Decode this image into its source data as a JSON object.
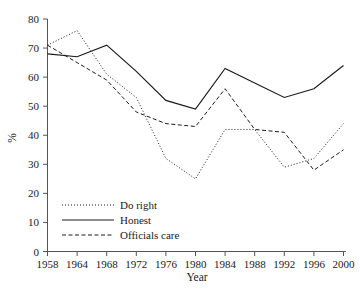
{
  "chart_data": {
    "type": "line",
    "title": "",
    "xlabel": "Year",
    "ylabel": "%",
    "xlim": [
      1958,
      2000
    ],
    "ylim": [
      0,
      80
    ],
    "grid": false,
    "legend_position": "bottom-left",
    "x": [
      1958,
      1964,
      1968,
      1972,
      1976,
      1980,
      1984,
      1988,
      1992,
      1996,
      2000
    ],
    "xtick_labels": [
      "1958",
      "1964",
      "1968",
      "1972",
      "1976",
      "1980",
      "1984",
      "1988",
      "1992",
      "1996",
      "2000"
    ],
    "ytick_labels": [
      "0",
      "10",
      "20",
      "30",
      "40",
      "50",
      "60",
      "70",
      "80"
    ],
    "ytick_values": [
      0,
      10,
      20,
      30,
      40,
      50,
      60,
      70,
      80
    ],
    "series": [
      {
        "name": "Do right",
        "style": "dotted",
        "values": [
          71,
          76,
          61,
          53,
          32,
          25,
          42,
          42,
          29,
          32,
          44
        ]
      },
      {
        "name": "Honest",
        "style": "solid",
        "values": [
          68,
          67,
          71,
          62,
          52,
          49,
          63,
          58,
          53,
          56,
          64
        ]
      },
      {
        "name": "Officials care",
        "style": "dashed",
        "values": [
          71,
          65,
          59,
          48,
          44,
          43,
          56,
          42,
          41,
          28,
          35
        ]
      }
    ]
  },
  "legend": {
    "items": [
      {
        "label": "Do right",
        "style": "dotted"
      },
      {
        "label": "Honest",
        "style": "solid"
      },
      {
        "label": "Officials care",
        "style": "dashed"
      }
    ]
  },
  "colors": {
    "line": "#1a1a1a",
    "axis": "#555555",
    "background": "#ffffff"
  }
}
